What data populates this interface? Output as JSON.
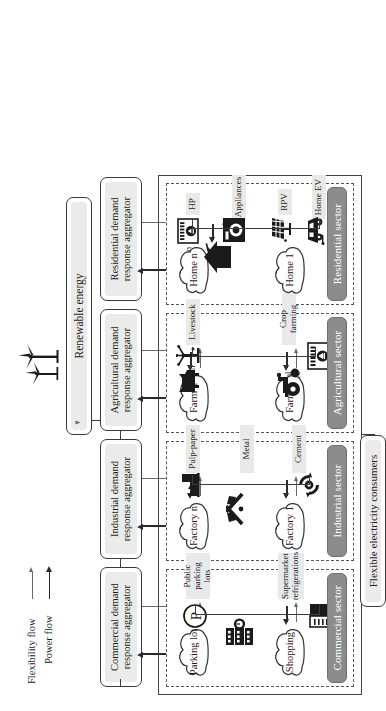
{
  "legend": {
    "items": [
      {
        "label": "Flexibility flow",
        "style": "thin-arrow",
        "color": "#6a6a6a"
      },
      {
        "label": "Power flow",
        "style": "thick-arrow",
        "color": "#2a2a2a"
      }
    ]
  },
  "source": {
    "label": "Renewable energy",
    "icon": "wind-turbine-icon"
  },
  "consumers_box": {
    "label": "Flexible electricity consumers"
  },
  "aggregators": [
    {
      "id": "residential",
      "label": "Residential demand response aggregator"
    },
    {
      "id": "agricultural",
      "label": "Agricultural demand response aggregator"
    },
    {
      "id": "industrial",
      "label": "Industrial demand response aggregator"
    },
    {
      "id": "commercial",
      "label": "Commercial demand response aggregator"
    }
  ],
  "sectors": [
    {
      "id": "residential",
      "tag": "Residential sector",
      "nodes": [
        {
          "label": "Home 1",
          "icon": "cloud-icon"
        },
        {
          "label": "Home n",
          "icon": "cloud-icon"
        }
      ],
      "hub_icon": "smart-home-icon",
      "assets": [
        {
          "label": "Home EV",
          "icon": "electric-car-icon"
        },
        {
          "label": "RPV",
          "icon": "solar-panel-icon"
        },
        {
          "label": "Appliances",
          "icon": "washing-machine-icon"
        },
        {
          "label": "HP",
          "icon": "heat-pump-icon"
        }
      ]
    },
    {
      "id": "agricultural",
      "tag": "Agricultural sector",
      "nodes": [
        {
          "label": "Farm 1",
          "icon": "cloud-icon"
        },
        {
          "label": "Farm n",
          "icon": "cloud-icon"
        }
      ],
      "hub_icon": "tractor-icon",
      "secondary_icon": "livestock-cow-icon",
      "assets": [
        {
          "label": "Crop farming",
          "icon": "tractor-icon"
        },
        {
          "label": "Livestock",
          "icon": "livestock-cow-icon"
        },
        {
          "label": "HP",
          "icon": "heat-pump-icon"
        },
        {
          "label": "Irrigation pumps",
          "icon": "irrigation-pump-icon"
        }
      ]
    },
    {
      "id": "industrial",
      "tag": "Industrial sector",
      "nodes": [
        {
          "label": "Factory 1",
          "icon": "cloud-icon"
        },
        {
          "label": "Factory n",
          "icon": "cloud-icon"
        }
      ],
      "hub_icon": "hammer-wrench-icon",
      "assets": [
        {
          "label": "Cement",
          "icon": "hammer-wrench-icon"
        },
        {
          "label": "Metal",
          "icon": "hammer-wrench-icon"
        },
        {
          "label": "Pulp-paper",
          "icon": "factory-icon"
        },
        {
          "label": "Industrial processes",
          "icon": "gear-cycle-icon"
        },
        {
          "label": "Self-generation",
          "icon": "factory-icon"
        }
      ]
    },
    {
      "id": "commercial",
      "tag": "Commercial sector",
      "nodes": [
        {
          "label": "Shopping",
          "icon": "cloud-icon"
        },
        {
          "label": "Parking lot",
          "icon": "cloud-icon"
        }
      ],
      "hub_icon": "mall-building-icon",
      "assets": [
        {
          "label": "Supermarket refrigerations",
          "icon": "refrigerator-icon"
        },
        {
          "label": "Public parking lots",
          "icon": "parking-p-icon"
        }
      ]
    }
  ],
  "colors": {
    "sector_tag_fill": "#8c8c8c",
    "box_fill": "#ebebeb",
    "caption_fill": "#e9e9e9",
    "line": "#3c3c3c",
    "power_flow": "#2a2a2a",
    "flexibility_flow": "#6a6a6a"
  }
}
